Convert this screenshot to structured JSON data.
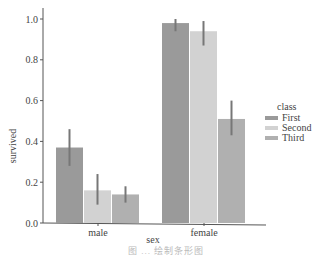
{
  "chart_data": {
    "type": "bar",
    "title": "",
    "xlabel": "sex",
    "ylabel": "survived",
    "categories": [
      "male",
      "female"
    ],
    "ylim": [
      0,
      1.0
    ],
    "yticks": [
      "0.0",
      "0.2",
      "0.4",
      "0.6",
      "0.8",
      "1.0"
    ],
    "grid": false,
    "legend": {
      "title": "class",
      "position": "right"
    },
    "series": [
      {
        "name": "First",
        "color": "#9a9a9a",
        "values": [
          0.37,
          0.98
        ],
        "ci_low": [
          0.28,
          0.94
        ],
        "ci_high": [
          0.46,
          1.0
        ]
      },
      {
        "name": "Second",
        "color": "#d2d2d2",
        "values": [
          0.16,
          0.94
        ],
        "ci_low": [
          0.09,
          0.87
        ],
        "ci_high": [
          0.24,
          0.99
        ]
      },
      {
        "name": "Third",
        "color": "#b0b0b0",
        "values": [
          0.14,
          0.51
        ],
        "ci_low": [
          0.1,
          0.43
        ],
        "ci_high": [
          0.18,
          0.6
        ]
      }
    ],
    "errorbar_color": "#777777"
  },
  "caption": "图 ... 绘制条形图"
}
